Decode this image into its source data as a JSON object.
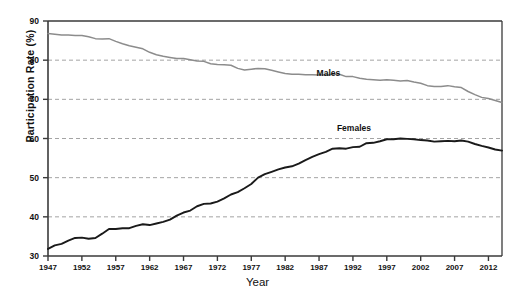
{
  "chart_data": {
    "type": "line",
    "title": "",
    "xlabel": "Year",
    "ylabel": "Participation Rate (%)",
    "xlim": [
      1947,
      2014
    ],
    "ylim": [
      30,
      90
    ],
    "grid": true,
    "grid_axis": "y",
    "legend_position": "inline-annotations",
    "y_ticks": [
      30,
      40,
      50,
      60,
      70,
      80,
      90
    ],
    "x_ticks": [
      1947,
      1952,
      1957,
      1962,
      1967,
      1972,
      1977,
      1982,
      1987,
      1992,
      1997,
      2002,
      2007,
      2012
    ],
    "annotations": [
      {
        "text": "Males",
        "x": 1989,
        "y": 76.5
      },
      {
        "text": "Females",
        "x": 1992,
        "y": 62.3
      }
    ],
    "x": [
      1947,
      1948,
      1949,
      1950,
      1951,
      1952,
      1953,
      1954,
      1955,
      1956,
      1957,
      1958,
      1959,
      1960,
      1961,
      1962,
      1963,
      1964,
      1965,
      1966,
      1967,
      1968,
      1969,
      1970,
      1971,
      1972,
      1973,
      1974,
      1975,
      1976,
      1977,
      1978,
      1979,
      1980,
      1981,
      1982,
      1983,
      1984,
      1985,
      1986,
      1987,
      1988,
      1989,
      1990,
      1991,
      1992,
      1993,
      1994,
      1995,
      1996,
      1997,
      1998,
      1999,
      2000,
      2001,
      2002,
      2003,
      2004,
      2005,
      2006,
      2007,
      2008,
      2009,
      2010,
      2011,
      2012,
      2013,
      2014
    ],
    "series": [
      {
        "name": "Males",
        "color": "#8c8c8c",
        "values": [
          86.8,
          86.6,
          86.4,
          86.4,
          86.3,
          86.3,
          86.0,
          85.5,
          85.4,
          85.5,
          84.8,
          84.2,
          83.7,
          83.3,
          82.9,
          82.0,
          81.4,
          81.0,
          80.7,
          80.4,
          80.4,
          80.1,
          79.8,
          79.7,
          79.1,
          78.9,
          78.8,
          78.7,
          77.9,
          77.5,
          77.7,
          77.9,
          77.8,
          77.4,
          77.0,
          76.6,
          76.4,
          76.4,
          76.3,
          76.3,
          76.2,
          76.2,
          76.4,
          76.4,
          75.8,
          75.8,
          75.4,
          75.1,
          75.0,
          74.9,
          75.0,
          74.9,
          74.7,
          74.8,
          74.4,
          74.1,
          73.5,
          73.3,
          73.3,
          73.5,
          73.2,
          73.0,
          72.0,
          71.2,
          70.5,
          70.2,
          69.7,
          69.2
        ]
      },
      {
        "name": "Females",
        "color": "#1a1a1a",
        "values": [
          31.8,
          32.7,
          33.1,
          33.9,
          34.6,
          34.7,
          34.4,
          34.6,
          35.7,
          36.9,
          36.9,
          37.1,
          37.1,
          37.7,
          38.1,
          37.9,
          38.3,
          38.7,
          39.3,
          40.3,
          41.1,
          41.6,
          42.7,
          43.3,
          43.4,
          43.9,
          44.7,
          45.7,
          46.3,
          47.3,
          48.4,
          50.0,
          50.9,
          51.5,
          52.1,
          52.6,
          52.9,
          53.6,
          54.5,
          55.3,
          56.0,
          56.6,
          57.4,
          57.5,
          57.4,
          57.8,
          57.9,
          58.8,
          58.9,
          59.3,
          59.8,
          59.8,
          60.0,
          59.9,
          59.8,
          59.6,
          59.5,
          59.2,
          59.3,
          59.4,
          59.3,
          59.5,
          59.2,
          58.6,
          58.1,
          57.7,
          57.2,
          56.9
        ]
      }
    ]
  }
}
